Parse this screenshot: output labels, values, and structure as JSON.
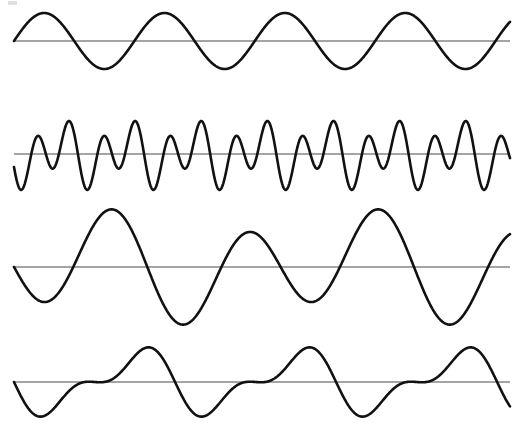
{
  "figure": {
    "width": 521,
    "height": 424,
    "background_color": "#ffffff",
    "ink_color": "#111111",
    "axis_color": "#4a4a4a",
    "wave_stroke_width": 2.6,
    "axis_stroke_width": 1.1
  },
  "chart_data": {
    "type": "line",
    "subtitle": "",
    "xlabel": "",
    "ylabel": "",
    "grid": false,
    "legend": "none",
    "x": {
      "start": 14,
      "end": 510,
      "samples": 1200
    },
    "series": [
      {
        "name": "wave-1-pure-sine",
        "label": "Pure sinusoid",
        "baseline_y": 41,
        "x_start": 14,
        "x_end": 510,
        "amplitude": 28,
        "cycles": 4.12,
        "phase_deg": 0,
        "components": [
          {
            "amplitude": 28,
            "cycles": 4.12,
            "phase_deg": 0
          }
        ],
        "envelope": {
          "type": "constant",
          "value": 1
        }
      },
      {
        "name": "wave-2-high-frequency-beat",
        "label": "High frequency carrier with beat modulation",
        "baseline_y": 154,
        "x_start": 14,
        "x_end": 510,
        "amplitude": 38,
        "cycles": 15.0,
        "phase_deg": 200,
        "components": [
          {
            "amplitude": 25,
            "cycles": 15.0,
            "phase_deg": 200
          },
          {
            "amplitude": 13,
            "cycles": 7.5,
            "phase_deg": 200
          }
        ],
        "envelope": {
          "type": "constant",
          "value": 1
        }
      },
      {
        "name": "wave-3-amplitude-modulated",
        "label": "Amplitude modulated sinusoid",
        "baseline_y": 267,
        "x_start": 14,
        "x_end": 510,
        "amplitude": 62,
        "cycles": 3.72,
        "phase_deg": 180,
        "components": [
          {
            "amplitude": 46,
            "cycles": 3.72,
            "phase_deg": 180
          },
          {
            "amplitude": 16,
            "cycles": 1.86,
            "phase_deg": 0
          }
        ],
        "envelope": {
          "type": "constant",
          "value": 1
        }
      },
      {
        "name": "wave-4-two-tone-sum",
        "label": "Sum of two sinusoids",
        "baseline_y": 382,
        "x_start": 14,
        "x_end": 510,
        "amplitude": 40,
        "cycles": 3.08,
        "phase_deg": 180,
        "components": [
          {
            "amplitude": 26,
            "cycles": 3.08,
            "phase_deg": 180
          },
          {
            "amplitude": 14,
            "cycles": 6.16,
            "phase_deg": 180
          }
        ],
        "envelope": {
          "type": "constant",
          "value": 1
        }
      }
    ],
    "axes": [
      {
        "name": "axis-1",
        "y": 41,
        "x_start": 14,
        "x_end": 510
      },
      {
        "name": "axis-2",
        "y": 154,
        "x_start": 14,
        "x_end": 510
      },
      {
        "name": "axis-3",
        "y": 267,
        "x_start": 14,
        "x_end": 510
      },
      {
        "name": "axis-4",
        "y": 382,
        "x_start": 14,
        "x_end": 510
      }
    ]
  },
  "artifacts": [
    {
      "name": "scan-speck-top-left",
      "x": 8,
      "y": 1,
      "width": 9,
      "height": 4
    }
  ]
}
